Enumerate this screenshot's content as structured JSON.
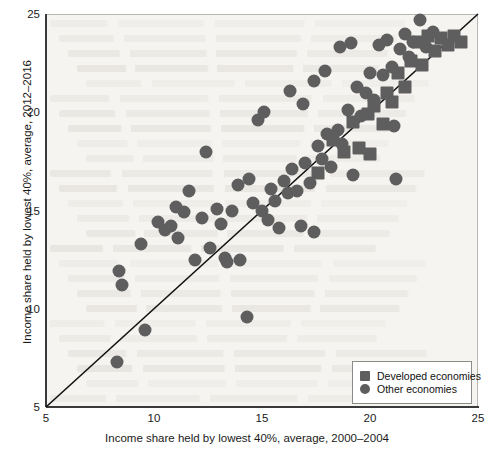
{
  "chart_data": {
    "type": "scatter",
    "title": "",
    "xlabel": "Income share held by lowest 40%, average, 2000–2004",
    "ylabel": "Income share held by lowest 40%, average, 2012–2016",
    "xlim": [
      5,
      25
    ],
    "ylim": [
      5,
      25
    ],
    "xticks": [
      "5",
      "10",
      "15",
      "20",
      "25"
    ],
    "yticks": [
      "5",
      "10",
      "15",
      "20",
      "25"
    ],
    "grid": false,
    "legend_position": "bottom-right",
    "reference_line": {
      "name": "45-degree-line",
      "from": [
        5,
        5
      ],
      "to": [
        25,
        25
      ]
    },
    "colors": {
      "marker": "#5e5e5e",
      "background": "#f6f4f0",
      "axis": "#3a3a3a",
      "frame": "#b9b7b3",
      "text": "#1a1a1a"
    },
    "series": [
      {
        "name": "Developed economies",
        "marker": "square",
        "points": [
          [
            17.6,
            16.9
          ],
          [
            18.3,
            18.6
          ],
          [
            18.8,
            18.0
          ],
          [
            19.2,
            19.5
          ],
          [
            19.5,
            18.2
          ],
          [
            19.9,
            19.9
          ],
          [
            20.0,
            17.9
          ],
          [
            20.2,
            20.3
          ],
          [
            20.6,
            19.4
          ],
          [
            20.8,
            21.0
          ],
          [
            21.0,
            20.5
          ],
          [
            21.3,
            22.0
          ],
          [
            21.6,
            21.3
          ],
          [
            21.9,
            22.6
          ],
          [
            22.2,
            23.6
          ],
          [
            22.4,
            22.4
          ],
          [
            22.7,
            23.9
          ],
          [
            23.0,
            23.1
          ],
          [
            23.3,
            23.8
          ],
          [
            23.6,
            23.4
          ],
          [
            23.9,
            23.9
          ],
          [
            24.2,
            23.6
          ]
        ]
      },
      {
        "name": "Other economies",
        "marker": "circle",
        "points": [
          [
            8.3,
            7.3
          ],
          [
            8.4,
            11.9
          ],
          [
            8.5,
            11.2
          ],
          [
            9.4,
            13.3
          ],
          [
            9.6,
            8.9
          ],
          [
            10.2,
            14.4
          ],
          [
            10.5,
            14.0
          ],
          [
            10.8,
            14.2
          ],
          [
            11.0,
            15.2
          ],
          [
            11.1,
            13.6
          ],
          [
            11.4,
            14.9
          ],
          [
            11.6,
            16.0
          ],
          [
            11.9,
            12.5
          ],
          [
            12.2,
            14.6
          ],
          [
            12.4,
            18.0
          ],
          [
            12.6,
            13.1
          ],
          [
            12.9,
            15.1
          ],
          [
            13.1,
            14.3
          ],
          [
            13.3,
            12.6
          ],
          [
            13.4,
            12.4
          ],
          [
            13.6,
            15.0
          ],
          [
            13.9,
            16.3
          ],
          [
            14.0,
            12.5
          ],
          [
            14.3,
            9.6
          ],
          [
            14.4,
            16.6
          ],
          [
            14.6,
            15.4
          ],
          [
            14.8,
            19.6
          ],
          [
            15.0,
            15.0
          ],
          [
            15.1,
            20.0
          ],
          [
            15.3,
            14.5
          ],
          [
            15.4,
            16.1
          ],
          [
            15.6,
            15.5
          ],
          [
            15.8,
            14.1
          ],
          [
            16.0,
            16.5
          ],
          [
            16.2,
            15.9
          ],
          [
            16.4,
            17.1
          ],
          [
            16.6,
            16.0
          ],
          [
            16.8,
            14.2
          ],
          [
            17.0,
            17.4
          ],
          [
            17.2,
            16.4
          ],
          [
            17.4,
            13.9
          ],
          [
            17.6,
            18.3
          ],
          [
            17.8,
            17.6
          ],
          [
            18.0,
            18.9
          ],
          [
            18.2,
            17.2
          ],
          [
            18.5,
            19.1
          ],
          [
            18.7,
            18.4
          ],
          [
            19.0,
            20.1
          ],
          [
            19.2,
            16.8
          ],
          [
            19.4,
            21.3
          ],
          [
            19.6,
            19.8
          ],
          [
            19.8,
            21.0
          ],
          [
            20.0,
            22.0
          ],
          [
            20.2,
            20.6
          ],
          [
            20.4,
            23.4
          ],
          [
            20.6,
            21.9
          ],
          [
            20.8,
            23.7
          ],
          [
            21.0,
            22.3
          ],
          [
            21.2,
            16.6
          ],
          [
            21.4,
            23.2
          ],
          [
            21.6,
            24.0
          ],
          [
            21.8,
            22.8
          ],
          [
            22.0,
            23.6
          ],
          [
            22.3,
            24.7
          ],
          [
            22.6,
            23.3
          ],
          [
            22.9,
            24.1
          ],
          [
            19.1,
            23.5
          ],
          [
            18.6,
            23.3
          ],
          [
            17.9,
            22.1
          ],
          [
            17.4,
            21.6
          ],
          [
            16.9,
            20.4
          ],
          [
            16.3,
            21.1
          ],
          [
            21.1,
            19.3
          ]
        ]
      }
    ]
  },
  "legend": {
    "items": [
      {
        "label": "Developed economies",
        "marker": "square"
      },
      {
        "label": "Other economies",
        "marker": "circle"
      }
    ]
  }
}
